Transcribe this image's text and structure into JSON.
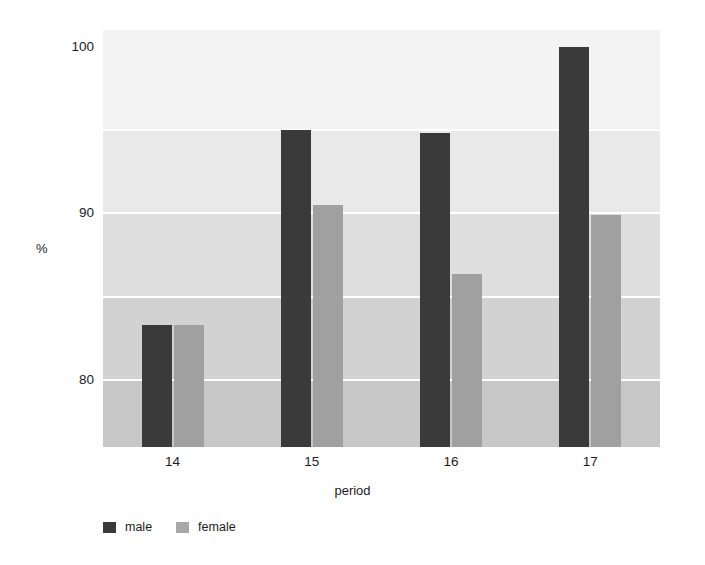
{
  "chart_data": {
    "type": "bar",
    "title": "",
    "xlabel": "period",
    "ylabel": "%",
    "categories": [
      "14",
      "15",
      "16",
      "17"
    ],
    "series": [
      {
        "name": "male",
        "color": "#3a3a3a",
        "values": [
          83.3,
          95.0,
          94.8,
          100.0
        ]
      },
      {
        "name": "female",
        "color": "#a0a0a0",
        "values": [
          83.3,
          90.5,
          86.4,
          89.9
        ]
      }
    ],
    "ylim": [
      76.0,
      101.0
    ],
    "yticks": [
      80,
      90,
      100
    ],
    "ytick_labels": [
      "80",
      "90",
      "100"
    ],
    "gridlines_y": [
      80,
      85,
      90,
      95
    ],
    "grid": true,
    "grid_color": "#ffffff",
    "legend_position": "bottom-left",
    "background_bands": [
      {
        "from": 101.0,
        "to": 95.0,
        "color": "#f3f3f3"
      },
      {
        "from": 95.0,
        "to": 90.0,
        "color": "#e9e9e9"
      },
      {
        "from": 90.0,
        "to": 85.0,
        "color": "#dedede"
      },
      {
        "from": 85.0,
        "to": 80.0,
        "color": "#d2d2d2"
      },
      {
        "from": 80.0,
        "to": 76.0,
        "color": "#c7c7c7"
      }
    ]
  },
  "axis": {
    "y_title": "%",
    "x_title": "period",
    "y_tick_0": "100",
    "y_tick_1": "90",
    "y_tick_2": "80",
    "x_tick_0": "14",
    "x_tick_1": "15",
    "x_tick_2": "16",
    "x_tick_3": "17"
  },
  "legend": {
    "items": [
      {
        "label": "male",
        "color": "#3a3a3a"
      },
      {
        "label": "female",
        "color": "#a8a8a8"
      }
    ]
  }
}
